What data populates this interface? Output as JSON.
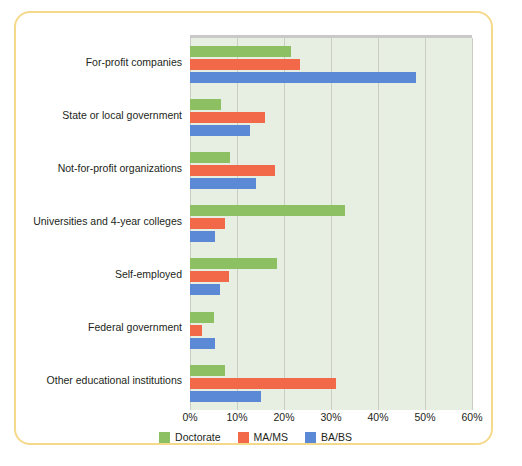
{
  "chart_data": {
    "type": "bar",
    "orientation": "horizontal",
    "title": "",
    "subtitle": "",
    "xlabel": "",
    "ylabel": "",
    "xlim": [
      0,
      60
    ],
    "xticks": [
      0,
      10,
      20,
      30,
      40,
      50,
      60
    ],
    "xtick_labels": [
      "0%",
      "10%",
      "20%",
      "30%",
      "40%",
      "50%",
      "60%"
    ],
    "grid": true,
    "grid_axis": "x",
    "legend_position": "bottom",
    "categories": [
      "For-profit companies",
      "State or local government",
      "Not-for-profit organizations",
      "Universities and 4-year colleges",
      "Self-employed",
      "Federal government",
      "Other educational institutions"
    ],
    "series": [
      {
        "name": "Doctorate",
        "color": "#8cc063",
        "values": [
          21.5,
          6.5,
          8.5,
          33.0,
          18.5,
          5.2,
          7.4
        ]
      },
      {
        "name": "MA/MS",
        "color": "#f2694a",
        "values": [
          23.5,
          16.0,
          18.0,
          7.4,
          8.2,
          2.6,
          31.0
        ]
      },
      {
        "name": "BA/BS",
        "color": "#5b89d6",
        "values": [
          48.0,
          12.8,
          14.0,
          5.3,
          6.3,
          5.3,
          15.0
        ]
      }
    ],
    "plot_background": "#e7efe2",
    "card_border_color": "#f5d98a"
  }
}
